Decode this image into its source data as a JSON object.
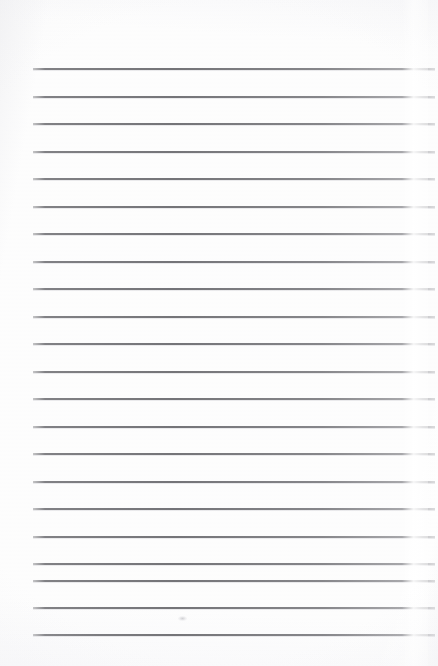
{
  "document": {
    "kind": "scanned-lined-notepad-page",
    "title": "Blank Lined Paper",
    "text_content": "",
    "page_width": 438,
    "page_height": 666,
    "paper_color": "#fdfdfd",
    "line_color": "#74747a",
    "line_count": 22,
    "line_left": 33,
    "line_right": 435,
    "line_thickness": 2,
    "line_spacing": 27.5,
    "first_line_y": 68,
    "lines": [
      {
        "index": 1,
        "y": 68,
        "text": ""
      },
      {
        "index": 2,
        "y": 96,
        "text": ""
      },
      {
        "index": 3,
        "y": 123,
        "text": ""
      },
      {
        "index": 4,
        "y": 151,
        "text": ""
      },
      {
        "index": 5,
        "y": 178,
        "text": ""
      },
      {
        "index": 6,
        "y": 206,
        "text": ""
      },
      {
        "index": 7,
        "y": 233,
        "text": ""
      },
      {
        "index": 8,
        "y": 261,
        "text": ""
      },
      {
        "index": 9,
        "y": 288,
        "text": ""
      },
      {
        "index": 10,
        "y": 316,
        "text": ""
      },
      {
        "index": 11,
        "y": 343,
        "text": ""
      },
      {
        "index": 12,
        "y": 371,
        "text": ""
      },
      {
        "index": 13,
        "y": 398,
        "text": ""
      },
      {
        "index": 14,
        "y": 426,
        "text": ""
      },
      {
        "index": 15,
        "y": 453,
        "text": ""
      },
      {
        "index": 16,
        "y": 481,
        "text": ""
      },
      {
        "index": 17,
        "y": 508,
        "text": ""
      },
      {
        "index": 18,
        "y": 536,
        "text": ""
      },
      {
        "index": 19,
        "y": 563,
        "text": ""
      },
      {
        "index": 20,
        "y": 580,
        "text": ""
      },
      {
        "index": 21,
        "y": 607,
        "text": ""
      },
      {
        "index": 22,
        "y": 634,
        "text": ""
      }
    ],
    "marks": [
      {
        "name": "faint-smudge",
        "x": 178,
        "y": 616,
        "note": ""
      }
    ]
  }
}
